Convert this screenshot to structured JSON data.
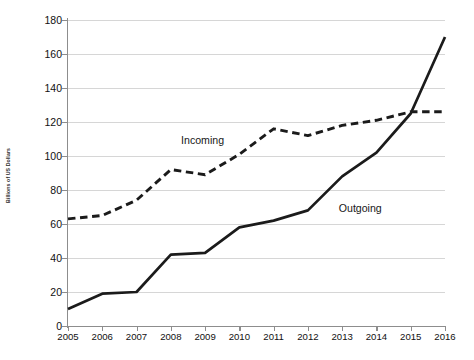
{
  "chart_data": {
    "type": "line",
    "title": "",
    "xlabel": "",
    "ylabel": "Billions of US Dollars",
    "categories": [
      "2005",
      "2006",
      "2007",
      "2008",
      "2009",
      "2010",
      "2011",
      "2012",
      "2013",
      "2014",
      "2015",
      "2016"
    ],
    "xlim": [
      2005,
      2016
    ],
    "ylim": [
      0,
      180
    ],
    "yticks": [
      0,
      20,
      40,
      60,
      80,
      100,
      120,
      140,
      160,
      180
    ],
    "grid": true,
    "legend_position": "inline-annotation",
    "series": [
      {
        "name": "Incoming",
        "style": "dashed",
        "color": "#1b1b1b",
        "values": [
          63,
          65,
          74,
          92,
          89,
          101,
          116,
          112,
          118,
          121,
          126,
          126
        ]
      },
      {
        "name": "Outgoing",
        "style": "solid",
        "color": "#1b1b1b",
        "values": [
          10,
          19,
          20,
          42,
          43,
          58,
          62,
          68,
          88,
          102,
          125,
          170
        ]
      }
    ],
    "annotations": [
      {
        "text": "Incoming",
        "x": 2009.0,
        "y": 108
      },
      {
        "text": "Outgoing",
        "x": 2012.9,
        "y": 68
      }
    ]
  },
  "axis": {
    "y_title": "Billions of US Dollars",
    "y_tick_labels": [
      "0",
      "20",
      "40",
      "60",
      "80",
      "100",
      "120",
      "140",
      "160",
      "180"
    ],
    "x_tick_labels": [
      "2005",
      "2006",
      "2007",
      "2008",
      "2009",
      "2010",
      "2011",
      "2012",
      "2013",
      "2014",
      "2015",
      "2016"
    ]
  },
  "labels": {
    "incoming": "Incoming",
    "outgoing": "Outgoing"
  }
}
